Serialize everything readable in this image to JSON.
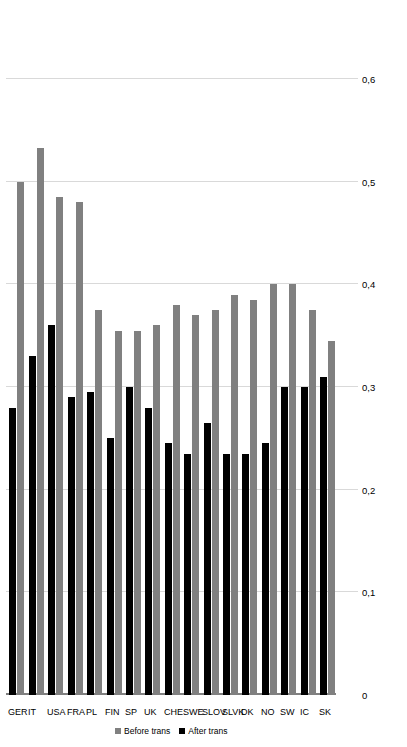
{
  "chart_data": {
    "type": "bar",
    "orientation": "horizontal",
    "title": "",
    "xlabel": "",
    "ylabel": "",
    "xlim": [
      0,
      0.6
    ],
    "xticks": [
      "0",
      "0,1",
      "0,2",
      "0,3",
      "0,4",
      "0,5",
      "0,6"
    ],
    "xtick_values": [
      0,
      0.1,
      0.2,
      0.3,
      0.4,
      0.5,
      0.6
    ],
    "grid": true,
    "legend_position": "bottom-right",
    "categories": [
      "SK",
      "IC",
      "SW",
      "NO",
      "DK",
      "SLVK",
      "SLOV",
      "SWE",
      "CHE",
      "UK",
      "SP",
      "FIN",
      "PL",
      "FRA",
      "USA",
      "IT",
      "GER"
    ],
    "series": [
      {
        "name": "Before trans",
        "color": "#808080",
        "values": [
          0.345,
          0.375,
          0.4,
          0.4,
          0.385,
          0.39,
          0.375,
          0.37,
          0.38,
          0.36,
          0.355,
          0.355,
          0.375,
          0.48,
          0.485,
          0.533,
          0.5
        ]
      },
      {
        "name": "After trans",
        "color": "#000000",
        "values": [
          0.31,
          0.3,
          0.3,
          0.245,
          0.235,
          0.235,
          0.265,
          0.235,
          0.245,
          0.28,
          0.3,
          0.25,
          0.295,
          0.29,
          0.36,
          0.33,
          0.28
        ]
      }
    ]
  },
  "legend": {
    "items": [
      {
        "label": "Before trans",
        "swatch": "before"
      },
      {
        "label": "After trans",
        "swatch": "after"
      }
    ]
  },
  "colors": {
    "before": "#808080",
    "after": "#000000",
    "grid": "#d9d9d9",
    "axis": "#808080",
    "background": "#ffffff"
  }
}
